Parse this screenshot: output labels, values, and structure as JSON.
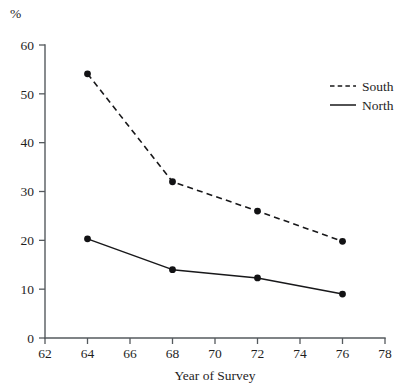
{
  "chart_data": {
    "type": "line",
    "title": "",
    "xlabel": "Year of Survey",
    "ylabel": "%",
    "x": [
      64,
      68,
      72,
      76
    ],
    "xlim": [
      62,
      78
    ],
    "ylim": [
      0,
      60
    ],
    "xticks": [
      62,
      64,
      66,
      68,
      70,
      72,
      74,
      76,
      78
    ],
    "yticks": [
      0,
      10,
      20,
      30,
      40,
      50,
      60
    ],
    "grid": false,
    "legend_position": "right",
    "markers": "filled-circle",
    "series": [
      {
        "name": "South",
        "style": "dashed",
        "values": [
          54.1,
          32.0,
          26.0,
          19.8
        ]
      },
      {
        "name": "North",
        "style": "solid",
        "values": [
          20.3,
          14.0,
          12.3,
          9.0
        ]
      }
    ]
  },
  "axes": {
    "y_label": "%",
    "x_label": "Year of Survey",
    "y_tick_labels": [
      "0",
      "10",
      "20",
      "30",
      "40",
      "50",
      "60"
    ],
    "x_tick_labels": [
      "62",
      "64",
      "66",
      "68",
      "70",
      "72",
      "74",
      "76",
      "78"
    ]
  },
  "legend": {
    "items": [
      {
        "label": "South",
        "style": "dashed"
      },
      {
        "label": "North",
        "style": "solid"
      }
    ]
  },
  "colors": {
    "line": "#18181a",
    "axis": "#555a5e",
    "text": "#1e1e1e",
    "background": "#ffffff"
  }
}
